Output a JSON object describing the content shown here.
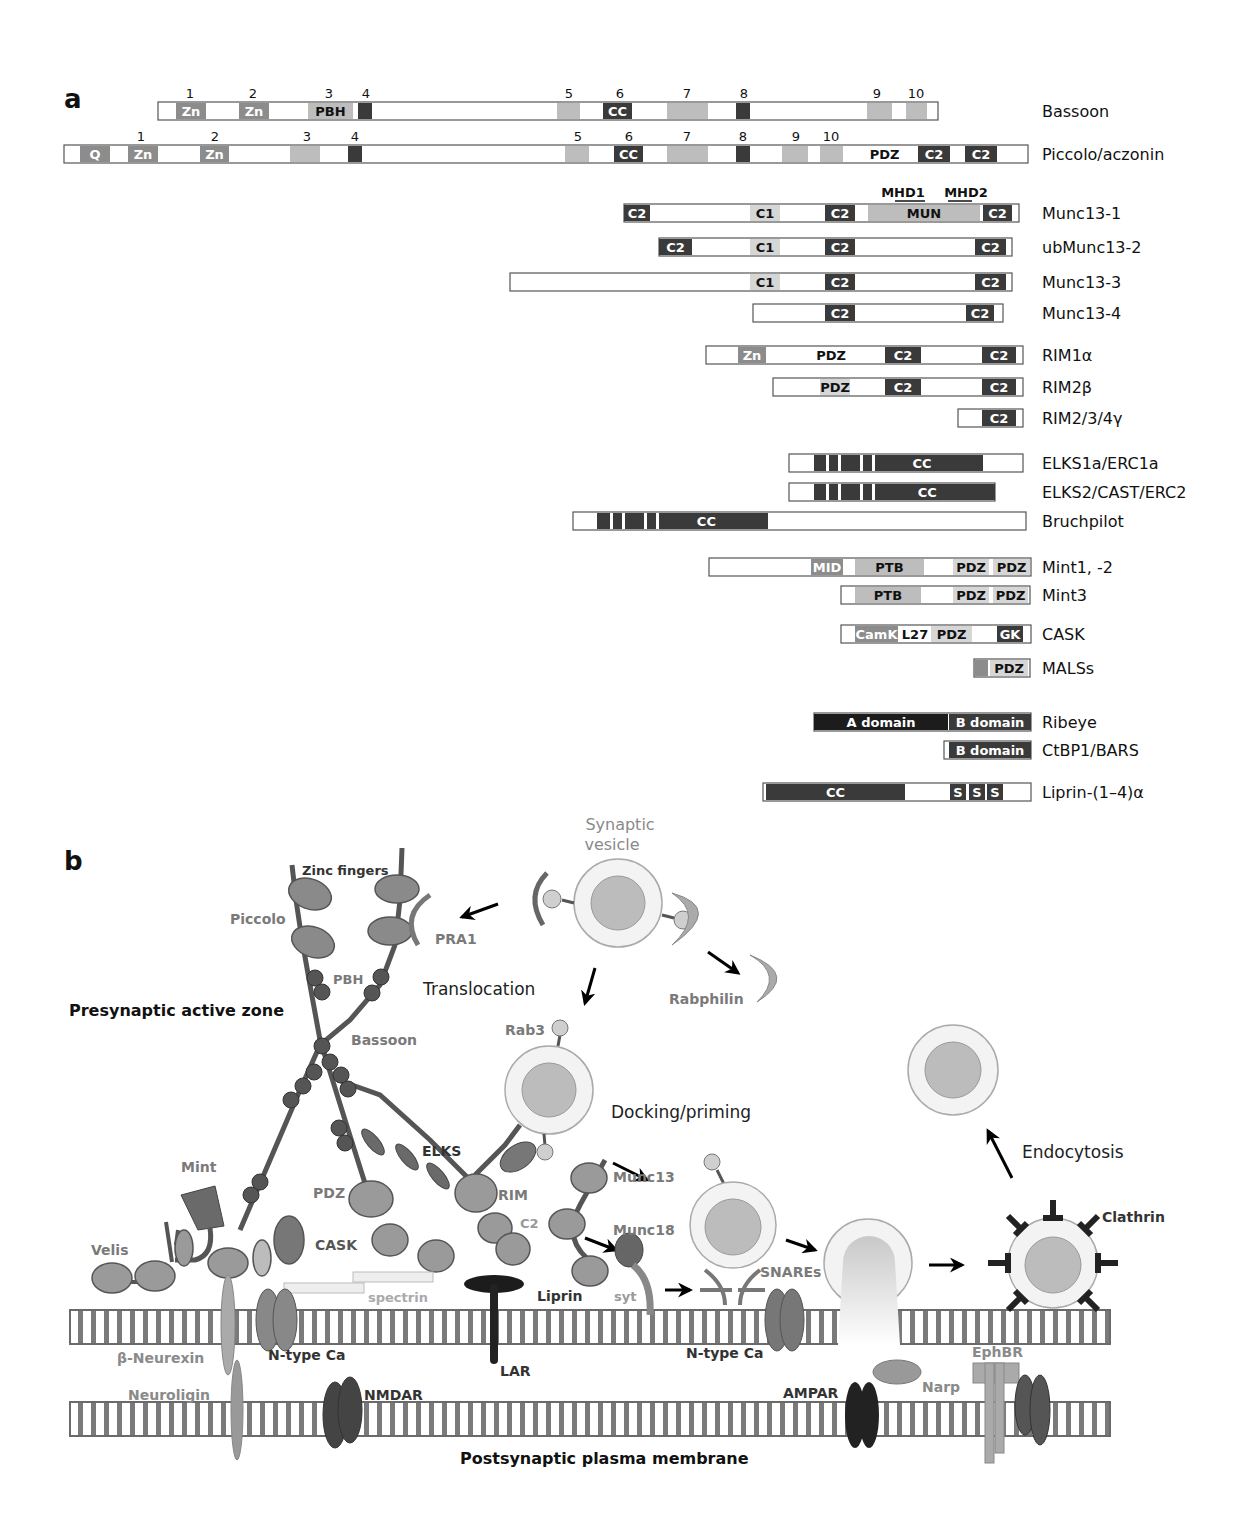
{
  "figure": {
    "panel_a": {
      "letter": "a",
      "proteins": [
        {
          "name": "Bassoon",
          "x1": 158,
          "x2": 938,
          "y": 111,
          "domains": [
            {
              "label": "Zn",
              "x1": 176,
              "x2": 206,
              "tone": "mid"
            },
            {
              "label": "Zn",
              "x1": 239,
              "x2": 269,
              "tone": "mid"
            },
            {
              "label": "PBH",
              "x1": 308,
              "x2": 353,
              "tone": "light",
              "text_dark": true
            },
            {
              "label": "",
              "x1": 358,
              "x2": 372,
              "tone": "dark"
            },
            {
              "label": "",
              "x1": 557,
              "x2": 580,
              "tone": "light"
            },
            {
              "label": "CC",
              "x1": 603,
              "x2": 632,
              "tone": "dark"
            },
            {
              "label": "",
              "x1": 667,
              "x2": 708,
              "tone": "light"
            },
            {
              "label": "",
              "x1": 736,
              "x2": 750,
              "tone": "dark"
            },
            {
              "label": "",
              "x1": 867,
              "x2": 892,
              "tone": "light"
            },
            {
              "label": "",
              "x1": 906,
              "x2": 927,
              "tone": "light"
            }
          ],
          "numbers": [
            {
              "n": "1",
              "x": 190
            },
            {
              "n": "2",
              "x": 253
            },
            {
              "n": "3",
              "x": 329
            },
            {
              "n": "4",
              "x": 366
            },
            {
              "n": "5",
              "x": 569
            },
            {
              "n": "6",
              "x": 620
            },
            {
              "n": "7",
              "x": 687
            },
            {
              "n": "8",
              "x": 744
            },
            {
              "n": "9",
              "x": 877
            },
            {
              "n": "10",
              "x": 916
            }
          ]
        },
        {
          "name": "Piccolo/aczonin",
          "x1": 64,
          "x2": 1028,
          "y": 154,
          "domains": [
            {
              "label": "Q",
              "x1": 80,
              "x2": 110,
              "tone": "mid"
            },
            {
              "label": "Zn",
              "x1": 128,
              "x2": 158,
              "tone": "mid"
            },
            {
              "label": "Zn",
              "x1": 200,
              "x2": 229,
              "tone": "mid"
            },
            {
              "label": "",
              "x1": 290,
              "x2": 320,
              "tone": "light"
            },
            {
              "label": "",
              "x1": 348,
              "x2": 362,
              "tone": "dark"
            },
            {
              "label": "",
              "x1": 565,
              "x2": 589,
              "tone": "light"
            },
            {
              "label": "CC",
              "x1": 614,
              "x2": 643,
              "tone": "dark"
            },
            {
              "label": "",
              "x1": 667,
              "x2": 708,
              "tone": "light"
            },
            {
              "label": "",
              "x1": 736,
              "x2": 750,
              "tone": "dark"
            },
            {
              "label": "",
              "x1": 782,
              "x2": 808,
              "tone": "light"
            },
            {
              "label": "",
              "x1": 820,
              "x2": 843,
              "tone": "light"
            },
            {
              "label": "PDZ",
              "x1": 864,
              "x2": 905,
              "tone": "none",
              "text_dark": true
            },
            {
              "label": "C2",
              "x1": 918,
              "x2": 950,
              "tone": "dark"
            },
            {
              "label": "C2",
              "x1": 965,
              "x2": 997,
              "tone": "dark"
            }
          ],
          "numbers": [
            {
              "n": "1",
              "x": 141
            },
            {
              "n": "2",
              "x": 215
            },
            {
              "n": "3",
              "x": 307
            },
            {
              "n": "4",
              "x": 355
            },
            {
              "n": "5",
              "x": 578
            },
            {
              "n": "6",
              "x": 629
            },
            {
              "n": "7",
              "x": 687
            },
            {
              "n": "8",
              "x": 743
            },
            {
              "n": "9",
              "x": 796
            },
            {
              "n": "10",
              "x": 831
            }
          ]
        },
        {
          "name": "Munc13-1",
          "x1": 624,
          "x2": 1019,
          "y": 213,
          "domains": [
            {
              "label": "C2",
              "x1": 624,
              "x2": 650,
              "tone": "dark"
            },
            {
              "label": "C1",
              "x1": 750,
              "x2": 780,
              "tone": "pale",
              "text_dark": true
            },
            {
              "label": "C2",
              "x1": 825,
              "x2": 855,
              "tone": "dark"
            },
            {
              "label": "MUN",
              "x1": 868,
              "x2": 980,
              "tone": "light",
              "text_dark": true
            },
            {
              "label": "C2",
              "x1": 983,
              "x2": 1012,
              "tone": "dark"
            }
          ],
          "annotations": [
            {
              "label": "MHD1",
              "x": 903,
              "underline_x1": 895,
              "underline_x2": 925
            },
            {
              "label": "MHD2",
              "x": 966,
              "underline_x1": 948,
              "underline_x2": 972
            }
          ]
        },
        {
          "name": "ubMunc13-2",
          "x1": 659,
          "x2": 1012,
          "y": 247,
          "domains": [
            {
              "label": "C2",
              "x1": 659,
              "x2": 692,
              "tone": "dark"
            },
            {
              "label": "C1",
              "x1": 750,
              "x2": 780,
              "tone": "pale",
              "text_dark": true
            },
            {
              "label": "C2",
              "x1": 825,
              "x2": 855,
              "tone": "dark"
            },
            {
              "label": "C2",
              "x1": 975,
              "x2": 1006,
              "tone": "dark"
            }
          ]
        },
        {
          "name": "Munc13-3",
          "x1": 510,
          "x2": 1012,
          "y": 282,
          "domains": [
            {
              "label": "C1",
              "x1": 750,
              "x2": 780,
              "tone": "pale",
              "text_dark": true
            },
            {
              "label": "C2",
              "x1": 825,
              "x2": 855,
              "tone": "dark"
            },
            {
              "label": "C2",
              "x1": 975,
              "x2": 1006,
              "tone": "dark"
            }
          ]
        },
        {
          "name": "Munc13-4",
          "x1": 753,
          "x2": 1003,
          "y": 313,
          "domains": [
            {
              "label": "C2",
              "x1": 825,
              "x2": 855,
              "tone": "dark"
            },
            {
              "label": "C2",
              "x1": 966,
              "x2": 994,
              "tone": "dark"
            }
          ]
        },
        {
          "name": "RIM1α",
          "x1": 706,
          "x2": 1023,
          "y": 355,
          "domains": [
            {
              "label": "Zn",
              "x1": 738,
              "x2": 766,
              "tone": "mid"
            },
            {
              "label": "PDZ",
              "x1": 812,
              "x2": 850,
              "tone": "none",
              "text_dark": true
            },
            {
              "label": "C2",
              "x1": 885,
              "x2": 921,
              "tone": "dark"
            },
            {
              "label": "C2",
              "x1": 982,
              "x2": 1016,
              "tone": "dark"
            }
          ]
        },
        {
          "name": "RIM2β",
          "x1": 773,
          "x2": 1023,
          "y": 387,
          "domains": [
            {
              "label": "PDZ",
              "x1": 820,
              "x2": 850,
              "tone": "pale",
              "text_dark": true
            },
            {
              "label": "C2",
              "x1": 885,
              "x2": 921,
              "tone": "dark"
            },
            {
              "label": "C2",
              "x1": 982,
              "x2": 1016,
              "tone": "dark"
            }
          ]
        },
        {
          "name": "RIM2/3/4γ",
          "x1": 958,
          "x2": 1023,
          "y": 418,
          "domains": [
            {
              "label": "C2",
              "x1": 982,
              "x2": 1016,
              "tone": "dark"
            }
          ]
        },
        {
          "name": "ELKS1a/ERC1a",
          "x1": 789,
          "x2": 1023,
          "y": 463,
          "domains": [
            {
              "label": "CC",
              "x1": 814,
              "x2": 983,
              "tone": "dark",
              "stripes": [
                826,
                838,
                860,
                872
              ]
            }
          ]
        },
        {
          "name": "ELKS2/CAST/ERC2",
          "x1": 789,
          "x2": 995,
          "y": 492,
          "domains": [
            {
              "label": "CC",
              "x1": 814,
              "x2": 995,
              "tone": "dark",
              "stripes": [
                826,
                838,
                860,
                872
              ]
            }
          ]
        },
        {
          "name": "Bruchpilot",
          "x1": 573,
          "x2": 1026,
          "y": 521,
          "domains": [
            {
              "label": "CC",
              "x1": 597,
              "x2": 768,
              "tone": "dark",
              "stripes": [
                610,
                622,
                644,
                656
              ]
            }
          ]
        },
        {
          "name": "Mint1, -2",
          "x1": 709,
          "x2": 1031,
          "y": 567,
          "domains": [
            {
              "label": "MID",
              "x1": 811,
              "x2": 843,
              "tone": "mid"
            },
            {
              "label": "PTB",
              "x1": 855,
              "x2": 924,
              "tone": "light",
              "text_dark": true
            },
            {
              "label": "PDZ",
              "x1": 953,
              "x2": 989,
              "tone": "pale",
              "text_dark": true
            },
            {
              "label": "PDZ",
              "x1": 993,
              "x2": 1030,
              "tone": "pale",
              "text_dark": true
            }
          ]
        },
        {
          "name": "Mint3",
          "x1": 841,
          "x2": 1030,
          "y": 595,
          "domains": [
            {
              "label": "PTB",
              "x1": 855,
              "x2": 921,
              "tone": "light",
              "text_dark": true
            },
            {
              "label": "PDZ",
              "x1": 953,
              "x2": 989,
              "tone": "pale",
              "text_dark": true
            },
            {
              "label": "PDZ",
              "x1": 993,
              "x2": 1028,
              "tone": "pale",
              "text_dark": true
            }
          ]
        },
        {
          "name": "CASK",
          "x1": 841,
          "x2": 1031,
          "y": 634,
          "domains": [
            {
              "label": "CamK",
              "x1": 855,
              "x2": 898,
              "tone": "mid"
            },
            {
              "label": "L27",
              "x1": 900,
              "x2": 930,
              "tone": "none",
              "text_dark": true
            },
            {
              "label": "PDZ",
              "x1": 931,
              "x2": 972,
              "tone": "pale",
              "text_dark": true
            },
            {
              "label": "GK",
              "x1": 997,
              "x2": 1023,
              "tone": "dark"
            }
          ]
        },
        {
          "name": "MALSs",
          "x1": 974,
          "x2": 1030,
          "y": 668,
          "domains": [
            {
              "label": "",
              "x1": 974,
              "x2": 988,
              "tone": "mid"
            },
            {
              "label": "PDZ",
              "x1": 990,
              "x2": 1028,
              "tone": "pale",
              "text_dark": true
            }
          ]
        },
        {
          "name": "Ribeye",
          "x1": 814,
          "x2": 1031,
          "y": 722,
          "domains": [
            {
              "label": "A domain",
              "x1": 814,
              "x2": 948,
              "tone": "black"
            },
            {
              "label": "B domain",
              "x1": 949,
              "x2": 1031,
              "tone": "dark"
            }
          ]
        },
        {
          "name": "CtBP1/BARS",
          "x1": 944,
          "x2": 1031,
          "y": 750,
          "domains": [
            {
              "label": "B domain",
              "x1": 949,
              "x2": 1031,
              "tone": "dark"
            }
          ]
        },
        {
          "name": "Liprin-(1–4)α",
          "x1": 763,
          "x2": 1031,
          "y": 792,
          "domains": [
            {
              "label": "CC",
              "x1": 766,
              "x2": 905,
              "tone": "dark"
            },
            {
              "label": "S",
              "x1": 950,
              "x2": 966,
              "tone": "dark"
            },
            {
              "label": "S",
              "x1": 969,
              "x2": 985,
              "tone": "dark"
            },
            {
              "label": "S",
              "x1": 987,
              "x2": 1003,
              "tone": "dark"
            }
          ]
        }
      ]
    },
    "panel_b": {
      "letter": "b",
      "labels": {
        "synaptic_vesicle": [
          "Synaptic",
          "vesicle"
        ],
        "zinc_fingers": "Zinc fingers",
        "piccolo": "Piccolo",
        "pra1": "PRA1",
        "pbh": "PBH",
        "translocation": "Translocation",
        "rabphilin": "Rabphilin",
        "presynaptic_active_zone": "Presynaptic active zone",
        "bassoon": "Bassoon",
        "rab3": "Rab3",
        "docking_priming": "Docking/priming",
        "endocytosis": "Endocytosis",
        "mint": "Mint",
        "elks": "ELKS",
        "munc13": "Munc13",
        "pdz": "PDZ",
        "rim": "RIM",
        "c2": "C2",
        "munc18": "Munc18",
        "clathrin": "Clathrin",
        "velis": "Velis",
        "cask": "CASK",
        "spectrin": "spectrin",
        "liprin": "Liprin",
        "syt": "syt",
        "snares": "SNAREs",
        "beta_neurexin": "β-Neurexin",
        "n_type_ca_1": "N-type Ca",
        "lar": "LAR",
        "n_type_ca_2": "N-type Ca",
        "ephbr": "EphBR",
        "neuroligin": "Neuroligin",
        "nmdar": "NMDAR",
        "ampar": "AMPAR",
        "narp": "Narp",
        "postsynaptic_plasma_membrane": "Postsynaptic plasma membrane"
      }
    },
    "colors": {
      "dark": "#3a3a3a",
      "black": "#1c1c1c",
      "mid": "#8c8c8c",
      "light": "#bdbdbd",
      "pale": "#d6d6d6",
      "outline": "#555555",
      "membrane_stroke": "#6a6a6a",
      "bead": "#555555",
      "blob": "#9a9a9a",
      "vesicle_outer": "#f3f3f3",
      "vesicle_inner": "#bcbcbc",
      "gray_text": "#7a7a7a",
      "dark_text": "#333333"
    }
  }
}
